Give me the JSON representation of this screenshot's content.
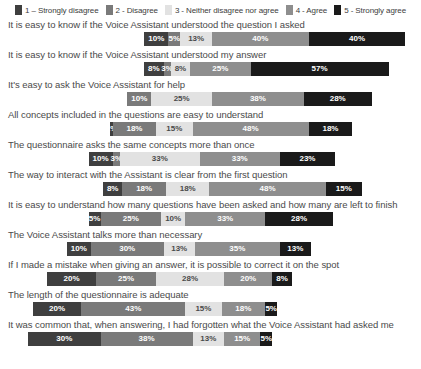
{
  "chart_data": {
    "type": "bar",
    "subtype": "diverging-stacked-likert",
    "title": "",
    "xlabel": "",
    "ylabel": "",
    "grid": false,
    "legend_position": "top",
    "legend": [
      {
        "key": "1",
        "label": "1 – Strongly disagree",
        "color": "#3f3f3f"
      },
      {
        "key": "2",
        "label": "2 - Disagree",
        "color": "#7a7a7a"
      },
      {
        "key": "3",
        "label": "3 - Neither disagree nor agree",
        "color": "#e2e2e2"
      },
      {
        "key": "4",
        "label": "4 - Agree",
        "color": "#8e8e8e"
      },
      {
        "key": "5",
        "label": "5 - Strongly agree",
        "color": "#1a1a1a"
      }
    ],
    "categories": [
      "It is easy to know if the Voice Assistant understood the question I asked",
      "It is easy to know if the Voice Assistant understood my answer",
      "It's easy to ask the Voice Assistant for help",
      "All concepts included in the questions are easy to understand",
      "The questionnaire asks the same concepts more than once",
      "The way to interact with the Assistant is clear from the first question",
      "It is easy to understand how many questions have been asked and how many are left to finish",
      "The Voice Assistant talks more than necessary",
      "If I made a mistake when giving an answer, it is possible to correct it on the spot",
      "The length of the questionnaire is adequate",
      "It was common that, when answering, I had forgotten what the Voice Assistant had asked me"
    ],
    "series": [
      {
        "name": "1 – Strongly disagree",
        "values": [
          10,
          8,
          0,
          1,
          10,
          8,
          5,
          10,
          20,
          20,
          30
        ]
      },
      {
        "name": "2 - Disagree",
        "values": [
          5,
          3,
          10,
          18,
          3,
          18,
          25,
          30,
          25,
          43,
          38
        ]
      },
      {
        "name": "3 - Neither disagree nor agree",
        "values": [
          13,
          8,
          25,
          15,
          33,
          18,
          10,
          13,
          28,
          15,
          13
        ]
      },
      {
        "name": "4 - Agree",
        "values": [
          40,
          25,
          38,
          48,
          33,
          48,
          33,
          35,
          20,
          18,
          15
        ]
      },
      {
        "name": "5 - Strongly agree",
        "values": [
          40,
          57,
          28,
          18,
          23,
          15,
          28,
          13,
          8,
          5,
          5
        ]
      }
    ],
    "rows": [
      {
        "label": "It is easy to know if the Voice Assistant understood the question I asked",
        "segments": [
          {
            "key": "1",
            "value": 10,
            "text": "10%"
          },
          {
            "key": "2",
            "value": 5,
            "text": "5%"
          },
          {
            "key": "3",
            "value": 13,
            "text": "13%"
          },
          {
            "key": "4",
            "value": 40,
            "text": "40%"
          },
          {
            "key": "5",
            "value": 40,
            "text": "40%"
          }
        ],
        "offset": 48
      },
      {
        "label": "It is easy to know if the Voice Assistant understood my answer",
        "segments": [
          {
            "key": "1",
            "value": 8,
            "text": "8%"
          },
          {
            "key": "2",
            "value": 3,
            "text": "3%"
          },
          {
            "key": "3",
            "value": 8,
            "text": "8%"
          },
          {
            "key": "4",
            "value": 25,
            "text": "25%"
          },
          {
            "key": "5",
            "value": 57,
            "text": "57%"
          }
        ],
        "offset": 48
      },
      {
        "label": "It's easy to ask the Voice Assistant for help",
        "segments": [
          {
            "key": "2",
            "value": 10,
            "text": "10%"
          },
          {
            "key": "3",
            "value": 25,
            "text": "25%"
          },
          {
            "key": "4",
            "value": 38,
            "text": "38%"
          },
          {
            "key": "5",
            "value": 28,
            "text": "28%"
          }
        ],
        "offset": 41
      },
      {
        "label": "All concepts included in the questions are easy to understand",
        "segments": [
          {
            "key": "1",
            "value": 1,
            "text": "1%"
          },
          {
            "key": "2",
            "value": 18,
            "text": "18%"
          },
          {
            "key": "3",
            "value": 15,
            "text": "15%"
          },
          {
            "key": "4",
            "value": 48,
            "text": "48%"
          },
          {
            "key": "5",
            "value": 18,
            "text": "18%"
          }
        ],
        "offset": 34
      },
      {
        "label": "The questionnaire asks the same concepts more than once",
        "segments": [
          {
            "key": "1",
            "value": 10,
            "text": "10%"
          },
          {
            "key": "2",
            "value": 3,
            "text": "3%"
          },
          {
            "key": "3",
            "value": 33,
            "text": "33%"
          },
          {
            "key": "4",
            "value": 33,
            "text": "33%"
          },
          {
            "key": "5",
            "value": 23,
            "text": "23%"
          }
        ],
        "offset": 25
      },
      {
        "label": "The way to interact with the Assistant is clear from the first question",
        "segments": [
          {
            "key": "1",
            "value": 8,
            "text": "8%"
          },
          {
            "key": "2",
            "value": 18,
            "text": "18%"
          },
          {
            "key": "3",
            "value": 18,
            "text": "18%"
          },
          {
            "key": "4",
            "value": 48,
            "text": "48%"
          },
          {
            "key": "5",
            "value": 15,
            "text": "15%"
          }
        ],
        "offset": 31
      },
      {
        "label": "It is easy to understand how many questions have been asked and how many are left to finish",
        "segments": [
          {
            "key": "1",
            "value": 5,
            "text": "5%"
          },
          {
            "key": "2",
            "value": 25,
            "text": "25%"
          },
          {
            "key": "3",
            "value": 10,
            "text": "10%"
          },
          {
            "key": "4",
            "value": 33,
            "text": "33%"
          },
          {
            "key": "5",
            "value": 28,
            "text": "28%"
          }
        ],
        "offset": 25
      },
      {
        "label": "The Voice Assistant talks more than necessary",
        "segments": [
          {
            "key": "1",
            "value": 10,
            "text": "10%"
          },
          {
            "key": "2",
            "value": 30,
            "text": "30%"
          },
          {
            "key": "3",
            "value": 13,
            "text": "13%"
          },
          {
            "key": "4",
            "value": 35,
            "text": "35%"
          },
          {
            "key": "5",
            "value": 13,
            "text": "13%"
          }
        ],
        "offset": 16
      },
      {
        "label": "If I made a mistake when giving an answer, it is possible to correct it on the spot",
        "segments": [
          {
            "key": "1",
            "value": 20,
            "text": "20%"
          },
          {
            "key": "2",
            "value": 25,
            "text": "25%"
          },
          {
            "key": "3",
            "value": 28,
            "text": "28%"
          },
          {
            "key": "4",
            "value": 20,
            "text": "20%"
          },
          {
            "key": "5",
            "value": 8,
            "text": "8%"
          }
        ],
        "offset": 8
      },
      {
        "label": "The length of the questionnaire is adequate",
        "segments": [
          {
            "key": "1",
            "value": 20,
            "text": "20%"
          },
          {
            "key": "2",
            "value": 43,
            "text": "43%"
          },
          {
            "key": "3",
            "value": 15,
            "text": "15%"
          },
          {
            "key": "4",
            "value": 18,
            "text": "18%"
          },
          {
            "key": "5",
            "value": 5,
            "text": "5%"
          }
        ],
        "offset": 2
      },
      {
        "label": "It was common that, when answering, I had forgotten what the Voice Assistant had asked me",
        "segments": [
          {
            "key": "1",
            "value": 30,
            "text": "30%"
          },
          {
            "key": "2",
            "value": 38,
            "text": "38%"
          },
          {
            "key": "3",
            "value": 13,
            "text": "13%"
          },
          {
            "key": "4",
            "value": 15,
            "text": "15%"
          },
          {
            "key": "5",
            "value": 5,
            "text": "5%"
          }
        ],
        "offset": 0
      }
    ]
  }
}
